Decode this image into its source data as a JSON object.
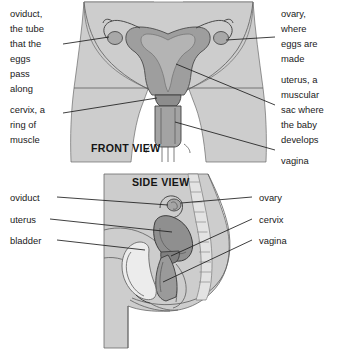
{
  "figure": {
    "background_color": "#ffffff",
    "body_fill": "#cdcdcd",
    "body_shade": "#c2c2c2",
    "organ_fill": "#9a9a9a",
    "organ_dark": "#8a8a8a",
    "bladder_fill": "#ececec",
    "outline_color": "#5d5d5d",
    "text_color": "#1a1a1a"
  },
  "panels": [
    {
      "id": "front",
      "view_label": "FRONT VIEW",
      "labels_left": [
        {
          "name": "oviduct",
          "lines": [
            "oviduct,",
            "the tube",
            "that the",
            "eggs",
            "pass",
            "along"
          ]
        },
        {
          "name": "cervix",
          "lines": [
            "cervix, a",
            "ring of",
            "muscle"
          ]
        }
      ],
      "labels_right": [
        {
          "name": "ovary",
          "lines": [
            "ovary,",
            "where",
            "eggs are",
            "made"
          ]
        },
        {
          "name": "uterus",
          "lines": [
            "uterus, a",
            "muscular",
            "sac where",
            "the baby",
            "develops"
          ]
        },
        {
          "name": "vagina",
          "lines": [
            "vagina"
          ]
        }
      ]
    },
    {
      "id": "side",
      "view_label": "SIDE VIEW",
      "labels_left": [
        {
          "name": "oviduct",
          "lines": [
            "oviduct"
          ]
        },
        {
          "name": "uterus",
          "lines": [
            "uterus"
          ]
        },
        {
          "name": "bladder",
          "lines": [
            "bladder"
          ]
        }
      ],
      "labels_right": [
        {
          "name": "ovary",
          "lines": [
            "ovary"
          ]
        },
        {
          "name": "cervix",
          "lines": [
            "cervix"
          ]
        },
        {
          "name": "vagina",
          "lines": [
            "vagina"
          ]
        }
      ]
    }
  ],
  "text": {
    "front_view": "FRONT VIEW",
    "side_view": "SIDE VIEW",
    "f_oviduct_1": "oviduct,",
    "f_oviduct_2": "the tube",
    "f_oviduct_3": "that the",
    "f_oviduct_4": "eggs",
    "f_oviduct_5": "pass",
    "f_oviduct_6": "along",
    "f_cervix_1": "cervix, a",
    "f_cervix_2": "ring of",
    "f_cervix_3": "muscle",
    "f_ovary_1": "ovary,",
    "f_ovary_2": "where",
    "f_ovary_3": "eggs are",
    "f_ovary_4": "made",
    "f_uterus_1": "uterus, a",
    "f_uterus_2": "muscular",
    "f_uterus_3": "sac where",
    "f_uterus_4": "the baby",
    "f_uterus_5": "develops",
    "f_vagina_1": "vagina",
    "s_oviduct": "oviduct",
    "s_uterus": "uterus",
    "s_bladder": "bladder",
    "s_ovary": "ovary",
    "s_cervix": "cervix",
    "s_vagina": "vagina"
  }
}
